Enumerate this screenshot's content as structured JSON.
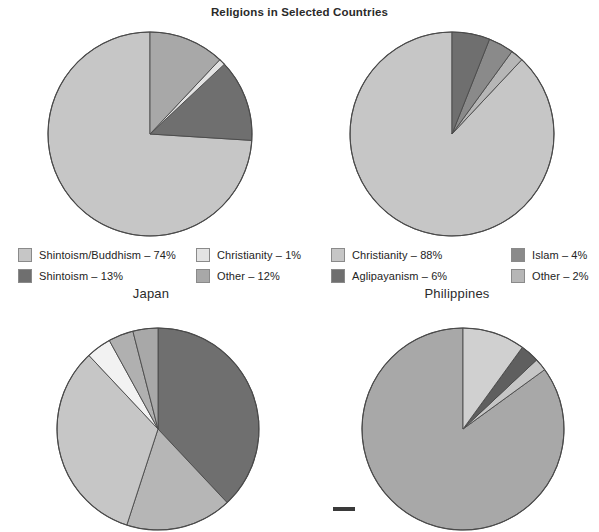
{
  "title": "Religions in Selected Countries",
  "colors": {
    "very_light": "#d9d9d9",
    "light": "#c6c6c6",
    "medium_light": "#b6b6b6",
    "medium": "#a8a8a8",
    "medium_dark": "#8a8a8a",
    "dark": "#6f6f6f",
    "darker": "#5f5f5f",
    "outline": "#4a4a4a",
    "white_slice": "#f2f2f2"
  },
  "charts": [
    {
      "id": "japan",
      "country_label": "Japan",
      "legend": [
        {
          "label": "Shintoism/Buddhism – 74%",
          "name": "Shintoism/Buddhism",
          "value": 74,
          "color": "#c6c6c6"
        },
        {
          "label": "Shintoism – 13%",
          "name": "Shintoism",
          "value": 13,
          "color": "#6f6f6f"
        },
        {
          "label": "Christianity – 1%",
          "name": "Christianity",
          "value": 1,
          "color": "#e3e3e3"
        },
        {
          "label": "Other – 12%",
          "name": "Other",
          "value": 12,
          "color": "#a8a8a8"
        }
      ]
    },
    {
      "id": "philippines",
      "country_label": "Philippines",
      "legend": [
        {
          "label": "Christianity – 88%",
          "name": "Christianity",
          "value": 88,
          "color": "#c6c6c6"
        },
        {
          "label": "Aglipayanism – 6%",
          "name": "Aglipayanism",
          "value": 6,
          "color": "#6f6f6f"
        },
        {
          "label": "Islam – 4%",
          "name": "Islam",
          "value": 4,
          "color": "#8a8a8a"
        },
        {
          "label": "Other – 2%",
          "name": "Other",
          "value": 2,
          "color": "#b6b6b6"
        }
      ]
    },
    {
      "id": "bottom-left",
      "country_label": "",
      "legend": []
    },
    {
      "id": "bottom-right",
      "country_label": "",
      "legend": []
    }
  ],
  "chart_data": [
    {
      "type": "pie",
      "title": "Japan",
      "labels": [
        "Shintoism/Buddhism",
        "Shintoism",
        "Christianity",
        "Other"
      ],
      "values": [
        74,
        13,
        1,
        12
      ],
      "units": "%",
      "colors": [
        "#c6c6c6",
        "#6f6f6f",
        "#e3e3e3",
        "#a8a8a8"
      ],
      "start_angle_deg": 0,
      "direction": "counter-clockwise",
      "legend_position": "below",
      "legend_columns": 2
    },
    {
      "type": "pie",
      "title": "Philippines",
      "labels": [
        "Christianity",
        "Other",
        "Islam",
        "Aglipayanism"
      ],
      "values": [
        88,
        2,
        4,
        6
      ],
      "units": "%",
      "colors": [
        "#c6c6c6",
        "#b6b6b6",
        "#8a8a8a",
        "#6f6f6f"
      ],
      "start_angle_deg": 0,
      "direction": "counter-clockwise",
      "legend_position": "below",
      "legend_columns": 2
    },
    {
      "type": "pie",
      "title": "",
      "note": "partially cropped at image bottom; legend not visible",
      "labels": [
        "slice-1",
        "slice-2",
        "slice-3",
        "slice-4",
        "slice-5",
        "slice-6"
      ],
      "values": [
        38,
        17,
        33,
        4,
        4,
        4
      ],
      "units": "%",
      "colors": [
        "#6f6f6f",
        "#b6b6b6",
        "#c6c6c6",
        "#f2f2f2",
        "#b0b0b0",
        "#a8a8a8"
      ],
      "start_angle_deg": 0,
      "direction": "clockwise",
      "legend_position": "none"
    },
    {
      "type": "pie",
      "title": "",
      "note": "partially cropped at image bottom; legend not visible",
      "labels": [
        "slice-1",
        "slice-2",
        "slice-3",
        "slice-4"
      ],
      "values": [
        85,
        2,
        3,
        10
      ],
      "units": "%",
      "colors": [
        "#a8a8a8",
        "#c6c6c6",
        "#5f5f5f",
        "#d0d0d0"
      ],
      "start_angle_deg": 0,
      "direction": "counter-clockwise",
      "legend_position": "none"
    }
  ]
}
